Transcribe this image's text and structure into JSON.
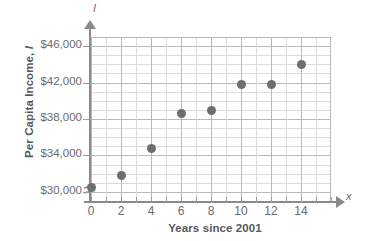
{
  "chart_data": {
    "type": "scatter",
    "title": "",
    "xlabel": "Years since 2001",
    "ylabel": "Per Capita Income, I",
    "x_axis_variable": "x",
    "y_axis_variable": "I",
    "xlim": [
      0,
      16
    ],
    "ylim": [
      29000,
      47000
    ],
    "y_axis_break": true,
    "grid": true,
    "legend": false,
    "x_ticks": [
      0,
      2,
      4,
      6,
      8,
      10,
      12,
      14
    ],
    "x_tick_labels": [
      "0",
      "2",
      "4",
      "6",
      "8",
      "10",
      "12",
      "14"
    ],
    "y_ticks": [
      30000,
      34000,
      38000,
      42000,
      46000
    ],
    "y_tick_labels": [
      "$30,000",
      "$34,000",
      "$38,000",
      "$42,000",
      "$46,000"
    ],
    "x_minor_step": 1,
    "y_minor_step": 1000,
    "point_color": "#6e6e70",
    "grid_color": "#b9b9bb",
    "axis_color": "#8a8a8c",
    "text_color": "#6b6b6d",
    "x": [
      0,
      2,
      4,
      6,
      8,
      10,
      12,
      14
    ],
    "values": [
      30500,
      31800,
      34800,
      38600,
      38900,
      41800,
      41800,
      44000
    ],
    "points": [
      {
        "x": 0,
        "y": 30500
      },
      {
        "x": 2,
        "y": 31800
      },
      {
        "x": 4,
        "y": 34800
      },
      {
        "x": 6,
        "y": 38600
      },
      {
        "x": 8,
        "y": 38900
      },
      {
        "x": 10,
        "y": 41800
      },
      {
        "x": 12,
        "y": 41800
      },
      {
        "x": 14,
        "y": 44000
      }
    ]
  },
  "axis_titles": {
    "y_prefix": "Per Capita Income, ",
    "y_variable": "I",
    "x": "Years since 2001"
  }
}
